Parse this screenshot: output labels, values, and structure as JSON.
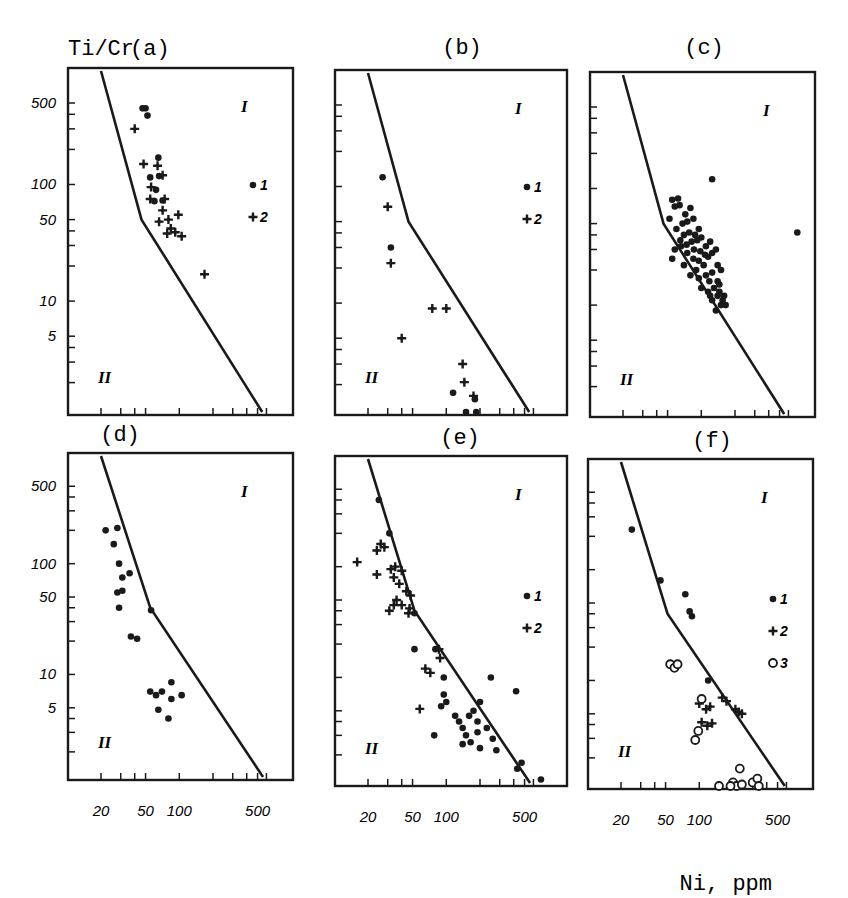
{
  "figure": {
    "y_axis_label": "Ti/Cr",
    "x_axis_label": "Ni, ppm",
    "y_tick_labels": [
      "500",
      "100",
      "50",
      "10",
      "5"
    ],
    "x_tick_labels": [
      "20",
      "50",
      "100",
      "500"
    ],
    "region_labels": {
      "upper": "I",
      "lower": "II"
    },
    "colors": {
      "ink": "#1a1a1a",
      "background": "#ffffff"
    }
  },
  "chart_data": [
    {
      "type": "scatter",
      "panel": "(a)",
      "xscale": "log",
      "yscale": "log",
      "xlabel": "Ni, ppm",
      "ylabel": "Ti/Cr",
      "xlim": [
        10.5,
        1000
      ],
      "ylim": [
        1,
        1000
      ],
      "boundary": [
        [
          20,
          1000
        ],
        [
          46,
          50
        ],
        [
          550,
          1
        ]
      ],
      "legend": [
        {
          "symbol": "dot",
          "label": "1"
        },
        {
          "symbol": "cross",
          "label": "2"
        }
      ],
      "series": [
        {
          "name": "1",
          "symbol": "dot",
          "points": [
            [
              47,
              450
            ],
            [
              50,
              450
            ],
            [
              52,
              390
            ],
            [
              65,
              170
            ],
            [
              55,
              115
            ],
            [
              66,
              118
            ],
            [
              62,
              90
            ],
            [
              60,
              72
            ],
            [
              71,
              73
            ]
          ]
        },
        {
          "name": "2",
          "symbol": "cross",
          "points": [
            [
              40,
              300
            ],
            [
              48,
              150
            ],
            [
              64,
              145
            ],
            [
              71,
              120
            ],
            [
              56,
              95
            ],
            [
              55,
              75
            ],
            [
              74,
              75
            ],
            [
              71,
              60
            ],
            [
              80,
              50
            ],
            [
              98,
              55
            ],
            [
              66,
              48
            ],
            [
              84,
              42
            ],
            [
              92,
              39
            ],
            [
              78,
              38
            ],
            [
              105,
              36
            ],
            [
              168,
              17
            ]
          ]
        }
      ]
    },
    {
      "type": "scatter",
      "panel": "(b)",
      "xscale": "log",
      "yscale": "log",
      "xlabel": "Ni, ppm",
      "ylabel": "Ti/Cr",
      "xlim": [
        10.5,
        1000
      ],
      "ylim": [
        1,
        1000
      ],
      "boundary": [
        [
          20,
          1000
        ],
        [
          46,
          50
        ],
        [
          550,
          1
        ]
      ],
      "legend": [
        {
          "symbol": "dot",
          "label": "1"
        },
        {
          "symbol": "cross",
          "label": "2"
        }
      ],
      "series": [
        {
          "name": "1",
          "symbol": "dot",
          "points": [
            [
              27,
              120
            ],
            [
              32,
              30
            ],
            [
              115,
              1.7
            ],
            [
              180,
              1.5
            ],
            [
              150,
              1.05
            ],
            [
              185,
              1.1
            ]
          ]
        },
        {
          "name": "2",
          "symbol": "cross",
          "points": [
            [
              30,
              67
            ],
            [
              32,
              22
            ],
            [
              75,
              9
            ],
            [
              100,
              9
            ],
            [
              40,
              5
            ],
            [
              140,
              3
            ],
            [
              145,
              2.1
            ],
            [
              175,
              1.6
            ]
          ]
        }
      ]
    },
    {
      "type": "scatter",
      "panel": "(c)",
      "xscale": "log",
      "yscale": "log",
      "xlabel": "Ni, ppm",
      "ylabel": "Ti/Cr",
      "xlim": [
        10.5,
        1000
      ],
      "ylim": [
        1,
        1000
      ],
      "boundary": [
        [
          20,
          1000
        ],
        [
          46,
          50
        ],
        [
          550,
          1
        ]
      ],
      "legend": [],
      "series": [
        {
          "name": "1",
          "symbol": "dot",
          "points": [
            [
              125,
              120
            ],
            [
              720,
              42
            ],
            [
              55,
              80
            ],
            [
              62,
              82
            ],
            [
              58,
              70
            ],
            [
              64,
              72
            ],
            [
              52,
              55
            ],
            [
              72,
              60
            ],
            [
              80,
              68
            ],
            [
              68,
              50
            ],
            [
              75,
              52
            ],
            [
              85,
              55
            ],
            [
              60,
              45
            ],
            [
              70,
              40
            ],
            [
              78,
              42
            ],
            [
              88,
              40
            ],
            [
              95,
              45
            ],
            [
              58,
              30
            ],
            [
              66,
              32
            ],
            [
              74,
              33
            ],
            [
              82,
              35
            ],
            [
              92,
              36
            ],
            [
              100,
              38
            ],
            [
              110,
              32
            ],
            [
              120,
              35
            ],
            [
              55,
              25
            ],
            [
              70,
              22
            ],
            [
              85,
              25
            ],
            [
              95,
              24
            ],
            [
              105,
              22
            ],
            [
              115,
              26
            ],
            [
              125,
              28
            ],
            [
              135,
              30
            ],
            [
              80,
              18
            ],
            [
              95,
              17
            ],
            [
              110,
              18
            ],
            [
              125,
              19
            ],
            [
              140,
              16
            ],
            [
              100,
              14
            ],
            [
              115,
              13
            ],
            [
              130,
              14
            ],
            [
              145,
              15
            ],
            [
              125,
              11
            ],
            [
              140,
              12
            ],
            [
              150,
              10
            ],
            [
              135,
              9
            ],
            [
              155,
              11
            ],
            [
              120,
              12
            ],
            [
              90,
              20
            ],
            [
              65,
              36
            ],
            [
              75,
              28
            ],
            [
              86,
              30
            ],
            [
              98,
              29
            ],
            [
              108,
              27
            ],
            [
              140,
              22
            ],
            [
              150,
              20
            ],
            [
              145,
              13
            ],
            [
              160,
              12
            ],
            [
              165,
              10
            ],
            [
              118,
              16
            ]
          ]
        }
      ]
    },
    {
      "type": "scatter",
      "panel": "(d)",
      "xscale": "log",
      "yscale": "log",
      "xlabel": "Ni, ppm",
      "ylabel": "Ti/Cr",
      "xlim": [
        10.5,
        1000
      ],
      "ylim": [
        1,
        1000
      ],
      "boundary": [
        [
          20,
          1000
        ],
        [
          55,
          40
        ],
        [
          560,
          1
        ]
      ],
      "legend": [],
      "series": [
        {
          "name": "1",
          "symbol": "dot",
          "points": [
            [
              22,
              200
            ],
            [
              28,
              210
            ],
            [
              26,
              150
            ],
            [
              29,
              100
            ],
            [
              31,
              75
            ],
            [
              36,
              82
            ],
            [
              28,
              55
            ],
            [
              31,
              57
            ],
            [
              29,
              40
            ],
            [
              56,
              38
            ],
            [
              37,
              22
            ],
            [
              42,
              21
            ],
            [
              55,
              7
            ],
            [
              62,
              6.5
            ],
            [
              70,
              7
            ],
            [
              85,
              8.5
            ],
            [
              85,
              6
            ],
            [
              105,
              6.5
            ],
            [
              65,
              4.8
            ],
            [
              80,
              4
            ]
          ]
        }
      ]
    },
    {
      "type": "scatter",
      "panel": "(e)",
      "xscale": "log",
      "yscale": "log",
      "xlabel": "Ni, ppm",
      "ylabel": "Ti/Cr",
      "xlim": [
        10.5,
        1000
      ],
      "ylim": [
        1,
        1000
      ],
      "boundary": [
        [
          20,
          1000
        ],
        [
          52,
          40
        ],
        [
          560,
          1
        ]
      ],
      "legend": [
        {
          "symbol": "dot",
          "label": "1"
        },
        {
          "symbol": "cross",
          "label": "2"
        }
      ],
      "series": [
        {
          "name": "1",
          "symbol": "dot",
          "points": [
            [
              25,
              400
            ],
            [
              31,
              200
            ],
            [
              52,
              38
            ],
            [
              52,
              18
            ],
            [
              80,
              18
            ],
            [
              95,
              10
            ],
            [
              95,
              7
            ],
            [
              100,
              6
            ],
            [
              90,
              5.5
            ],
            [
              120,
              4.5
            ],
            [
              130,
              4
            ],
            [
              140,
              3.5
            ],
            [
              160,
              4.5
            ],
            [
              175,
              5
            ],
            [
              190,
              4
            ],
            [
              200,
              6
            ],
            [
              150,
              3
            ],
            [
              190,
              3.2
            ],
            [
              230,
              3.5
            ],
            [
              260,
              2.8
            ],
            [
              78,
              3
            ],
            [
              140,
              2.5
            ],
            [
              165,
              2.6
            ],
            [
              200,
              2.3
            ],
            [
              250,
              10
            ],
            [
              420,
              7.5
            ],
            [
              430,
              1.5
            ],
            [
              470,
              1.7
            ],
            [
              700,
              1.2
            ],
            [
              280,
              2.2
            ]
          ]
        }
      ],
      "series_extra": [
        {
          "name": "2",
          "symbol": "cross",
          "points": [
            [
              16,
              110
            ],
            [
              24,
              140
            ],
            [
              26,
              160
            ],
            [
              28,
              150
            ],
            [
              24,
              85
            ],
            [
              32,
              95
            ],
            [
              35,
              100
            ],
            [
              40,
              92
            ],
            [
              34,
              80
            ],
            [
              38,
              70
            ],
            [
              44,
              60
            ],
            [
              36,
              50
            ],
            [
              34,
              45
            ],
            [
              31,
              40
            ],
            [
              40,
              45
            ],
            [
              47,
              42
            ],
            [
              48,
              55
            ],
            [
              46,
              38
            ],
            [
              86,
              18
            ],
            [
              88,
              15
            ],
            [
              65,
              12
            ],
            [
              72,
              11
            ],
            [
              58,
              5.2
            ]
          ]
        }
      ]
    },
    {
      "type": "scatter",
      "panel": "(f)",
      "xscale": "log",
      "yscale": "log",
      "xlabel": "Ni, ppm",
      "ylabel": "Ti/Cr",
      "xlim": [
        10.5,
        1000
      ],
      "ylim": [
        1,
        1000
      ],
      "boundary": [
        [
          20,
          1000
        ],
        [
          52,
          40
        ],
        [
          580,
          1
        ]
      ],
      "legend": [
        {
          "symbol": "dot",
          "label": "1"
        },
        {
          "symbol": "cross",
          "label": "2"
        },
        {
          "symbol": "open-circle",
          "label": "3"
        }
      ],
      "series": [
        {
          "name": "1",
          "symbol": "dot",
          "points": [
            [
              25,
              230
            ],
            [
              45,
              80
            ],
            [
              75,
              60
            ],
            [
              82,
              42
            ],
            [
              86,
              38
            ],
            [
              120,
              10
            ]
          ]
        },
        {
          "name": "2",
          "symbol": "cross",
          "points": [
            [
              100,
              6.2
            ],
            [
              115,
              5.5
            ],
            [
              125,
              5.8
            ],
            [
              105,
              4.2
            ],
            [
              118,
              3.9
            ],
            [
              130,
              4.1
            ],
            [
              160,
              7
            ],
            [
              175,
              6.5
            ],
            [
              210,
              5.5
            ],
            [
              225,
              5.2
            ],
            [
              240,
              5
            ]
          ]
        },
        {
          "name": "3",
          "symbol": "open-circle",
          "points": [
            [
              55,
              14
            ],
            [
              60,
              13
            ],
            [
              64,
              14
            ],
            [
              105,
              6.8
            ],
            [
              98,
              3.5
            ],
            [
              92,
              2.9
            ],
            [
              230,
              1.6
            ],
            [
              200,
              1.2
            ],
            [
              215,
              1.1
            ],
            [
              240,
              1.15
            ],
            [
              300,
              1.2
            ],
            [
              330,
              1.3
            ],
            [
              340,
              1.1
            ],
            [
              150,
              1.05
            ],
            [
              190,
              1.02
            ]
          ]
        }
      ]
    }
  ],
  "panels": [
    {
      "id": "a",
      "label": "(a)"
    },
    {
      "id": "b",
      "label": "(b)"
    },
    {
      "id": "c",
      "label": "(c)"
    },
    {
      "id": "d",
      "label": "(d)"
    },
    {
      "id": "e",
      "label": "(e)"
    },
    {
      "id": "f",
      "label": "(f)"
    }
  ]
}
